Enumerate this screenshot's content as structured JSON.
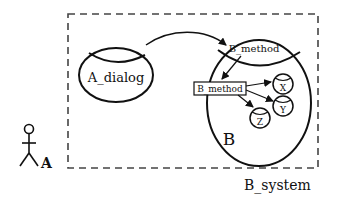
{
  "diagram": {
    "system_boundary": {
      "label": "B_system"
    },
    "actor": {
      "label": "A"
    },
    "a_dialog": {
      "label": "A_dialog"
    },
    "b_component": {
      "label": "B",
      "interface_label": "B_method",
      "method_box_label": "B_method",
      "subcomponents": [
        {
          "label": "X"
        },
        {
          "label": "Y"
        },
        {
          "label": "Z"
        }
      ]
    },
    "colors": {
      "stroke": "#111111",
      "boundary": "#444444",
      "background": "#ffffff"
    }
  }
}
